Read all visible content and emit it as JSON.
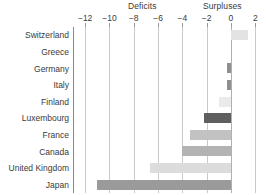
{
  "chart_data": {
    "type": "bar",
    "orientation": "horizontal",
    "title": "",
    "subtitle": "",
    "xlabel": "",
    "ylabel": "",
    "categories": [
      "Switzerland",
      "Greece",
      "Germany",
      "Italy",
      "Finland",
      "Luxembourg",
      "France",
      "Canada",
      "United Kingdom",
      "Japan"
    ],
    "values": [
      1.4,
      0.0,
      -0.3,
      -0.3,
      -1.0,
      -2.2,
      -3.4,
      -4.0,
      -6.7,
      -11.0
    ],
    "bar_colors": [
      "#e3e3e3",
      "#e3e3e3",
      "#8f8f8f",
      "#8f8f8f",
      "#eaeaea",
      "#5f5f5f",
      "#c2c2c2",
      "#b3b3b3",
      "#dcdcdc",
      "#9a9a9a"
    ],
    "xlim": [
      -13,
      2.8
    ],
    "xticks": [
      -12,
      -10,
      -8,
      -6,
      -4,
      -2,
      0,
      2
    ],
    "xtick_labels": [
      "−12",
      "−10",
      "−8",
      "−6",
      "−4",
      "−2",
      "0",
      "2"
    ],
    "grid": true,
    "grid_axis": "x",
    "legend": "none",
    "annotations": [
      {
        "text": "Deficits",
        "region": "negative"
      },
      {
        "text": "Surpluses",
        "region": "positive"
      }
    ]
  },
  "header": {
    "deficits_label": "Deficits",
    "surpluses_label": "Surpluses"
  },
  "colors": {
    "background": "#ffffff",
    "gridline": "#c9c9c9",
    "zero_line": "#b0b0b0",
    "axis_spine": "#8a8a8a",
    "text": "#3a3a3a"
  }
}
